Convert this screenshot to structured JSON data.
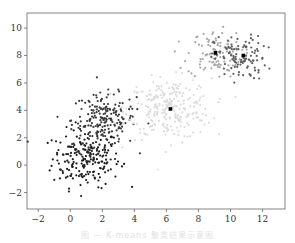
{
  "chart_data": {
    "type": "scatter",
    "title": "",
    "xlabel": "",
    "ylabel": "",
    "xlim": [
      -2.7,
      13.4
    ],
    "ylim": [
      -3.2,
      11.1
    ],
    "x_ticks": [
      -2,
      0,
      2,
      4,
      6,
      8,
      10,
      12
    ],
    "y_ticks": [
      -2,
      0,
      2,
      4,
      6,
      8,
      10
    ],
    "grid": false,
    "legend": null,
    "series": [
      {
        "name": "cluster-1",
        "color": "#1e1e1e",
        "center": [
          1.0,
          0.5
        ],
        "spread": [
          1.05,
          1.05
        ],
        "count": 210
      },
      {
        "name": "cluster-2",
        "color": "#3c3c3c",
        "center": [
          2.1,
          3.3
        ],
        "spread": [
          1.0,
          0.95
        ],
        "count": 200
      },
      {
        "name": "cluster-3",
        "color": "#dcdcdc",
        "center": [
          6.2,
          4.1
        ],
        "spread": [
          1.3,
          1.1
        ],
        "count": 260
      },
      {
        "name": "cluster-4",
        "color": "#a8a8a8",
        "center": [
          9.0,
          8.1
        ],
        "spread": [
          0.85,
          0.85
        ],
        "count": 110
      },
      {
        "name": "cluster-5",
        "color": "#5e5e5e",
        "center": [
          10.6,
          7.8
        ],
        "spread": [
          0.8,
          0.8
        ],
        "count": 110
      }
    ],
    "centroids": [
      {
        "x": 6.25,
        "y": 4.1,
        "color": "#000000"
      },
      {
        "x": 9.06,
        "y": 8.2,
        "color": "#000000"
      },
      {
        "x": 10.8,
        "y": 8.0,
        "color": "#000000"
      }
    ]
  },
  "caption": "图 — K-means 聚类结果示意图"
}
